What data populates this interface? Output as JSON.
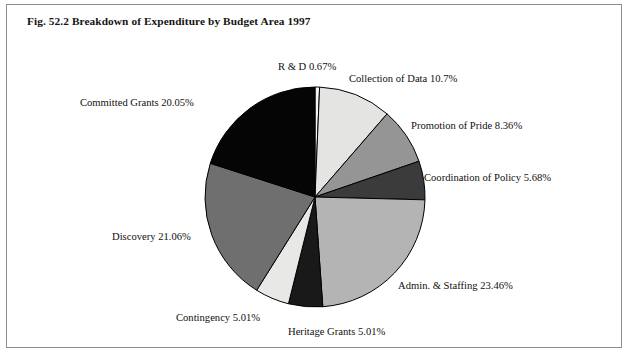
{
  "figure": {
    "title": "Fig. 52.2 Breakdown of Expenditure by Budget Area 1997",
    "border_color": "#8d8d8d",
    "background": "#ffffff"
  },
  "chart_data": {
    "type": "pie",
    "title": "Fig. 52.2 Breakdown of Expenditure by Budget Area 1997",
    "xlabel": "",
    "ylabel": "",
    "legend_position": "none",
    "grid": false,
    "start_angle_deg": 0,
    "direction": "clockwise",
    "units": "percent",
    "categories": [
      "R & D",
      "Collection of Data",
      "Promotion of Pride",
      "Coordination of Policy",
      "Admin. & Staffing",
      "Heritage Grants",
      "Contingency",
      "Discovery",
      "Committed Grants"
    ],
    "values": [
      0.67,
      10.7,
      8.36,
      5.68,
      23.46,
      5.01,
      5.01,
      21.06,
      20.05
    ],
    "slice_colors": [
      "#f4f4f4",
      "#e4e4e2",
      "#959595",
      "#3b3b3b",
      "#b4b4b4",
      "#191919",
      "#e8e8e6",
      "#6f6f6f",
      "#050505"
    ],
    "slice_edge_color": "#000000",
    "labels": [
      "R & D 0.67%",
      "Collection of Data 10.7%",
      "Promotion of Pride 8.36%",
      "Coordination of Policy 5.68%",
      "Admin. & Staffing 23.46%",
      "Heritage Grants 5.01%",
      "Contingency 5.01%",
      "Discovery 21.06%",
      "Committed Grants 20.05%"
    ],
    "label_positions": [
      {
        "x": 278,
        "y": 62,
        "align": "start"
      },
      {
        "x": 349,
        "y": 74,
        "align": "start"
      },
      {
        "x": 411,
        "y": 121,
        "align": "start"
      },
      {
        "x": 424,
        "y": 173,
        "align": "start"
      },
      {
        "x": 398,
        "y": 281,
        "align": "start"
      },
      {
        "x": 288,
        "y": 327,
        "align": "start"
      },
      {
        "x": 176,
        "y": 313,
        "align": "start"
      },
      {
        "x": 112,
        "y": 232,
        "align": "start"
      },
      {
        "x": 80,
        "y": 98,
        "align": "start"
      }
    ]
  },
  "pie_geometry": {
    "center_x": 315,
    "center_y": 197,
    "radius": 110
  }
}
